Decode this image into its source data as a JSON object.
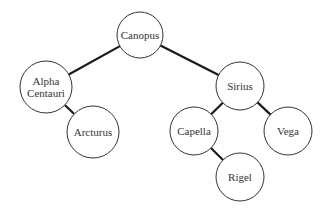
{
  "diagram": {
    "type": "binary-tree",
    "colors": {
      "background": "#ffffff",
      "edge": "#1a1a1a",
      "node_stroke": "#333333",
      "text": "#333333"
    },
    "nodes": [
      {
        "id": "canopus",
        "label": "Canopus",
        "lines": [
          "Canopus"
        ],
        "x": 140,
        "y": 35,
        "r": 23
      },
      {
        "id": "alpha-centauri",
        "label": "Alpha Centauri",
        "lines": [
          "Alpha",
          "Centauri"
        ],
        "x": 46,
        "y": 87,
        "r": 26
      },
      {
        "id": "arcturus",
        "label": "Arcturus",
        "lines": [
          "Arcturus"
        ],
        "x": 93,
        "y": 132,
        "r": 26
      },
      {
        "id": "sirius",
        "label": "Sirius",
        "lines": [
          "Sirius"
        ],
        "x": 240,
        "y": 86,
        "r": 24
      },
      {
        "id": "capella",
        "label": "Capella",
        "lines": [
          "Capella"
        ],
        "x": 194,
        "y": 131,
        "r": 24
      },
      {
        "id": "vega",
        "label": "Vega",
        "lines": [
          "Vega"
        ],
        "x": 288,
        "y": 131,
        "r": 24
      },
      {
        "id": "rigel",
        "label": "Rigel",
        "lines": [
          "Rigel"
        ],
        "x": 240,
        "y": 177,
        "r": 24
      }
    ],
    "edges": [
      {
        "from": "canopus",
        "to": "alpha-centauri"
      },
      {
        "from": "canopus",
        "to": "sirius"
      },
      {
        "from": "alpha-centauri",
        "to": "arcturus"
      },
      {
        "from": "sirius",
        "to": "capella"
      },
      {
        "from": "sirius",
        "to": "vega"
      },
      {
        "from": "capella",
        "to": "rigel"
      }
    ]
  }
}
